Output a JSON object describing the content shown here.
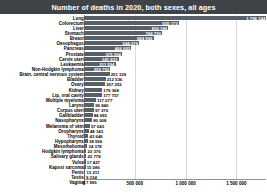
{
  "header": {
    "title": "Number of deaths in 2020, both sexes, all ages",
    "bar_color": "#3f4348"
  },
  "axis": {
    "ticks": [
      "0",
      "500 000",
      "1 000 000",
      "1 500 000"
    ],
    "tick_values": [
      0,
      500000,
      1000000,
      1500000
    ],
    "max": 1900000
  },
  "style": {
    "bar_color": "#595f66",
    "grid_color": "#d7d9db",
    "axis_color": "#8e9398",
    "text_color": "#000000"
  },
  "chart_data": {
    "type": "bar",
    "orientation": "horizontal",
    "title": "Number of deaths in 2020, both sexes, all ages",
    "xlabel": "",
    "ylabel": "",
    "xlim": [
      0,
      1900000
    ],
    "grid": true,
    "legend": "none",
    "categories": [
      "Lung",
      "Colorectum",
      "Liver",
      "Stomach",
      "Breast",
      "Oesophagus",
      "Pancreas",
      "Prostate",
      "Cervix uteri",
      "Leukaemia",
      "Non-Hodgkin lymphoma",
      "Brain, central nervous system",
      "Bladder",
      "Ovary",
      "Kidney",
      "Lip, oral cavity",
      "Multiple myeloma",
      "Larynx",
      "Corpus uteri",
      "Gallbladder",
      "Nasopharynx",
      "Melanoma of skin",
      "Oropharynx",
      "Thyroid",
      "Hypopharynx",
      "Mesothelioma",
      "Hodgkin lymphoma",
      "Salivary glands",
      "Vulva",
      "Kaposi sarcoma",
      "Penis",
      "Testis",
      "Vagina"
    ],
    "values": [
      1796144,
      935173,
      830180,
      768793,
      684996,
      544076,
      466003,
      375304,
      341831,
      311594,
      259793,
      251329,
      212536,
      207252,
      179368,
      177757,
      117077,
      99840,
      97370,
      84695,
      80008,
      57043,
      48143,
      43646,
      38599,
      34378,
      23376,
      22778,
      17427,
      15086,
      13211,
      9334,
      7995
    ],
    "value_labels": [
      "1 796 144",
      "935 173",
      "830 180",
      "768 793",
      "684 996",
      "544 076",
      "466 003",
      "375 304",
      "341 831",
      "311 594",
      "259 793",
      "251 329",
      "212 536",
      "207 252",
      "179 368",
      "177 757",
      "117 077",
      "99 840",
      "97 370",
      "84 695",
      "80 008",
      "57 043",
      "48 143",
      "43 646",
      "38 599",
      "34 378",
      "23 376",
      "22 778",
      "17 427",
      "15 086",
      "13 211",
      "9 334",
      "7 995"
    ]
  }
}
